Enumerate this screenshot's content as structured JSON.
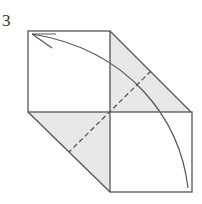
{
  "diagram": {
    "step_number": "3",
    "type": "origami-fold-step",
    "colors": {
      "line": "#555555",
      "shade": "#e8e8e8",
      "paper": "#ffffff"
    },
    "elements": {
      "upper_square": "white square, top-left",
      "lower_square": "white square, bottom-right",
      "upper_flap": "shaded triangle flap to right of upper square",
      "lower_flap": "shaded triangle flap to left of lower square",
      "valley_fold": "dashed diagonal line across both flaps",
      "arrow": "curved arrow from bottom-right corner to top-left corner"
    }
  }
}
